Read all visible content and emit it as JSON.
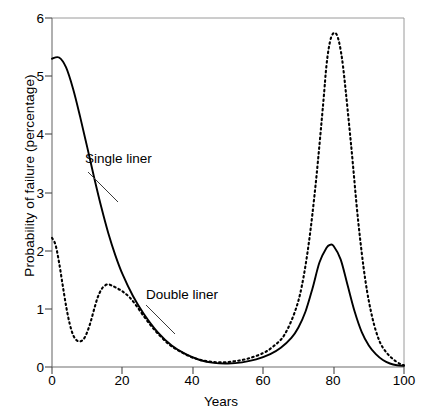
{
  "chart_data": {
    "type": "line",
    "title": "",
    "xlabel": "Years",
    "ylabel": "Probability of failure (percentage)",
    "xlim": [
      0,
      100
    ],
    "ylim": [
      0,
      6
    ],
    "xticks": [
      "0",
      "20",
      "40",
      "60",
      "80",
      "100"
    ],
    "xtick_values": [
      0,
      20,
      40,
      60,
      80,
      100
    ],
    "yticks": [
      "0",
      "1",
      "2",
      "3",
      "4",
      "5",
      "6"
    ],
    "ytick_values": [
      0,
      1,
      2,
      3,
      4,
      5,
      6
    ],
    "grid": false,
    "legend": "annotations-on-plot",
    "series": [
      {
        "name": "Single liner",
        "style": "solid",
        "color": "#000000",
        "x": [
          0,
          2,
          4,
          6,
          8,
          10,
          12,
          14,
          16,
          18,
          20,
          23,
          26,
          30,
          34,
          38,
          42,
          46,
          50,
          54,
          58,
          62,
          65,
          68,
          70,
          72,
          74,
          76,
          78,
          79,
          80,
          82,
          84,
          86,
          88,
          90,
          92,
          94,
          96,
          98,
          100
        ],
        "y": [
          5.3,
          5.32,
          5.15,
          4.78,
          4.3,
          3.78,
          3.25,
          2.75,
          2.3,
          1.92,
          1.6,
          1.22,
          0.92,
          0.6,
          0.37,
          0.22,
          0.12,
          0.07,
          0.06,
          0.08,
          0.13,
          0.22,
          0.33,
          0.5,
          0.68,
          0.95,
          1.35,
          1.8,
          2.05,
          2.1,
          2.08,
          1.85,
          1.4,
          0.95,
          0.6,
          0.37,
          0.22,
          0.12,
          0.06,
          0.03,
          0.02
        ]
      },
      {
        "name": "Double liner",
        "style": "dotted",
        "color": "#000000",
        "x": [
          0,
          1,
          2,
          3,
          4,
          5,
          6,
          7,
          8,
          9,
          10,
          11,
          12,
          13,
          14,
          15,
          16,
          17,
          18,
          20,
          22,
          24,
          26,
          28,
          30,
          33,
          36,
          40,
          44,
          48,
          52,
          56,
          60,
          63,
          66,
          69,
          71,
          73,
          75,
          77,
          78,
          79,
          80,
          81,
          82,
          83,
          85,
          87,
          89,
          91,
          93,
          95,
          97,
          99,
          100
        ],
        "y": [
          2.22,
          2.1,
          1.8,
          1.42,
          1.05,
          0.75,
          0.55,
          0.46,
          0.44,
          0.48,
          0.6,
          0.78,
          1.0,
          1.2,
          1.33,
          1.4,
          1.42,
          1.4,
          1.37,
          1.3,
          1.2,
          1.05,
          0.88,
          0.72,
          0.58,
          0.4,
          0.28,
          0.16,
          0.1,
          0.08,
          0.1,
          0.15,
          0.24,
          0.36,
          0.55,
          0.95,
          1.4,
          2.15,
          3.2,
          4.5,
          5.2,
          5.6,
          5.74,
          5.7,
          5.45,
          5.0,
          3.8,
          2.5,
          1.5,
          0.85,
          0.45,
          0.25,
          0.13,
          0.05,
          0.03
        ]
      }
    ],
    "annotations": [
      {
        "text": "Single liner",
        "label_x_px": 85,
        "label_y_px": 152,
        "leader_from_px": [
          88,
          172
        ],
        "leader_to_px": [
          118,
          202
        ]
      },
      {
        "text": "Double liner",
        "label_x_px": 146,
        "label_y_px": 288,
        "leader_from_px": [
          146,
          305
        ],
        "leader_to_px": [
          175,
          334
        ]
      }
    ]
  },
  "axes": {
    "ylabel": "Probability of failure (percentage)",
    "xlabel": "Years"
  }
}
